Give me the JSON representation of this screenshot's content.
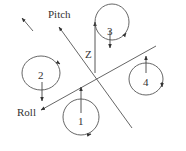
{
  "diagram": {
    "type": "quadrotor-axes-diagram",
    "axes": {
      "pitch": {
        "label": "Pitch"
      },
      "roll": {
        "label": "Roll"
      },
      "z": {
        "label": "Z"
      }
    },
    "rotors": [
      {
        "id": "1",
        "label": "1",
        "rotation": "counterclockwise",
        "thrust": "up"
      },
      {
        "id": "2",
        "label": "2",
        "rotation": "clockwise",
        "thrust": "down"
      },
      {
        "id": "3",
        "label": "3",
        "rotation": "counterclockwise",
        "thrust": "down"
      },
      {
        "id": "4",
        "label": "4",
        "rotation": "clockwise",
        "thrust": "up"
      }
    ],
    "colors": {
      "line": "#444444",
      "text": "#333333",
      "background": "#ffffff"
    }
  }
}
